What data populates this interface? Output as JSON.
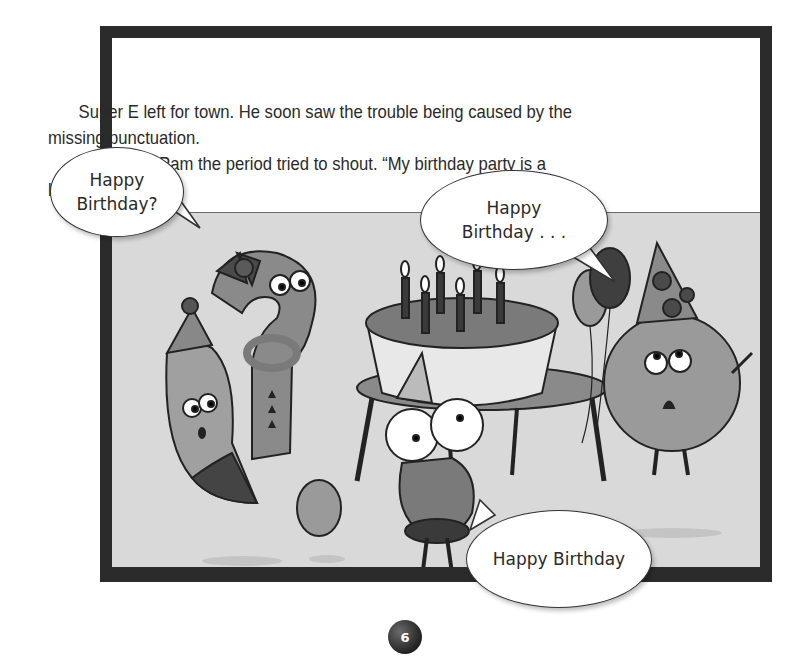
{
  "page": {
    "number": "6",
    "frame_color": "#2b2b2b",
    "illustration_bg": "#d9d9d9"
  },
  "story": {
    "paragraphs": [
      "Super E left for town. He soon saw the trouble being caused by the missing punctuation.",
      "“Super E,” Pam the period tried to shout. “My birthday party is a bust.”"
    ]
  },
  "speech_bubbles": [
    {
      "speaker": "question mark",
      "line1": "Happy",
      "line2": "Birthday?"
    },
    {
      "speaker": "Pam the period",
      "line1": "Happy",
      "line2": "Birthday . . ."
    },
    {
      "speaker": "Super E",
      "line1": "Happy Birthday"
    }
  ],
  "illustration": {
    "characters": [
      "question-mark",
      "comma",
      "exclamation-dot",
      "Super E",
      "Pam the period"
    ],
    "props": [
      "birthday cake",
      "candles",
      "table",
      "balloons",
      "party hats"
    ]
  }
}
